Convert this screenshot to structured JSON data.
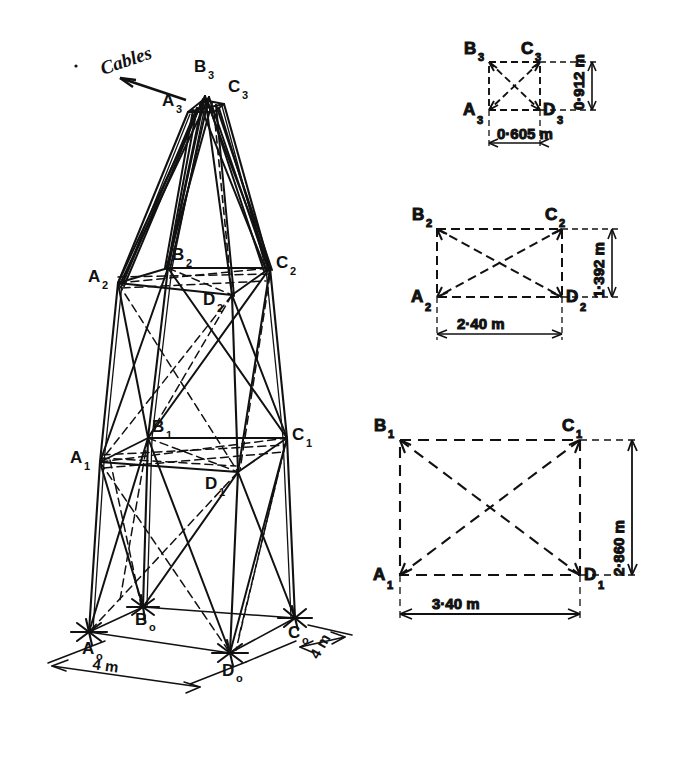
{
  "figure": {
    "annotation": "Cables"
  },
  "tower_3d": {
    "name": "tower-3d-view",
    "nodes": {
      "A3": "A",
      "A3sub": "3",
      "B3": "B",
      "B3sub": "3",
      "C3": "C",
      "C3sub": "3",
      "A2": "A",
      "A2sub": "2",
      "B2": "B",
      "B2sub": "2",
      "C2": "C",
      "C2sub": "2",
      "D2": "D",
      "D2sub": "2",
      "A1": "A",
      "A1sub": "1",
      "B1": "B",
      "B1sub": "1",
      "C1": "C",
      "C1sub": "1",
      "D1": "D",
      "D1sub": "1",
      "A0": "A",
      "A0sub": "o",
      "B0": "B",
      "B0sub": "o",
      "C0": "C",
      "C0sub": "o",
      "D0": "D",
      "D0sub": "o"
    },
    "dimensions": {
      "base_front": "4 m",
      "base_side": "4 m"
    }
  },
  "sections": [
    {
      "id": "section-level-3",
      "name": "cross-section-level-3",
      "corners": {
        "top_left": "B",
        "top_left_sub": "3",
        "top_right": "C",
        "top_right_sub": "3",
        "bottom_left": "A",
        "bottom_left_sub": "3",
        "bottom_right": "D",
        "bottom_right_sub": "3"
      },
      "height_label": "0·912 m",
      "width_label": "0·605 m",
      "height_m": 0.912,
      "width_m": 0.605
    },
    {
      "id": "section-level-2",
      "name": "cross-section-level-2",
      "corners": {
        "top_left": "B",
        "top_left_sub": "2",
        "top_right": "C",
        "top_right_sub": "2",
        "bottom_left": "A",
        "bottom_left_sub": "2",
        "bottom_right": "D",
        "bottom_right_sub": "2"
      },
      "height_label": "1·392 m",
      "width_label": "2·40 m",
      "height_m": 1.392,
      "width_m": 2.4
    },
    {
      "id": "section-level-1",
      "name": "cross-section-level-1",
      "corners": {
        "top_left": "B",
        "top_left_sub": "1",
        "top_right": "C",
        "top_right_sub": "1",
        "bottom_left": "A",
        "bottom_left_sub": "1",
        "bottom_right": "D",
        "bottom_right_sub": "1"
      },
      "height_label": "2·860 m",
      "width_label": "3·40 m",
      "height_m": 2.86,
      "width_m": 3.4
    }
  ],
  "colors": {
    "ink": "#111111",
    "paper": "#ffffff"
  }
}
